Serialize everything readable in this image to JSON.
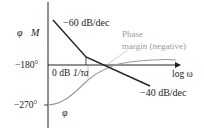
{
  "diagram": {
    "type": "bode-plot-sketch",
    "axes": {
      "y_label_phase": "φ",
      "y_label_magnitude": "M",
      "x_label": "log ω",
      "tick_phase_minus180": "−180°",
      "tick_phase_minus270": "−270°",
      "tick_zero_db": "0 dB",
      "tick_break_freq": "1/τa"
    },
    "curves": {
      "magnitude_slope_1": "−60 dB/dec",
      "magnitude_slope_2": "−40 dB/dec",
      "phase_label": "φ"
    },
    "annotations": {
      "phase_margin_line1": "Phase",
      "phase_margin_line2": "margin (negative)"
    },
    "colors": {
      "magnitude_line": "#222222",
      "phase_line": "#9a9a9a",
      "axis": "#222222",
      "annotation": "#9a9a9a"
    }
  }
}
